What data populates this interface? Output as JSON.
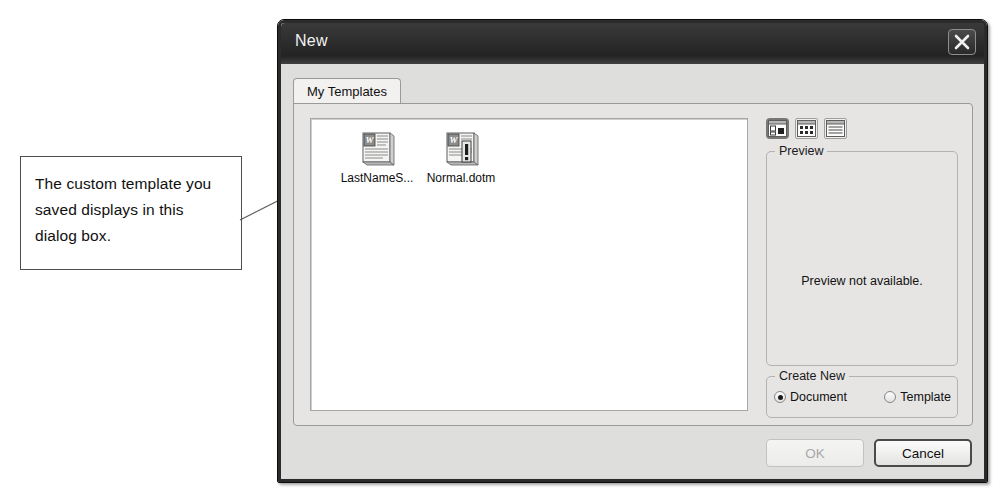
{
  "annotation": {
    "text": "The custom template you saved displays in this dialog box.",
    "leader_icon": "leader-line"
  },
  "dialog": {
    "title": "New",
    "close_icon": "close-icon",
    "tabs": [
      {
        "label": "My Templates",
        "selected": true
      }
    ],
    "templates": [
      {
        "label": "LastNameS...",
        "icon": "word-template-icon",
        "selected": false
      },
      {
        "label": "Normal.dotm",
        "icon": "word-macro-template-icon",
        "selected": false
      }
    ],
    "view_buttons": [
      {
        "icon": "large-icons-view-icon",
        "selected": true
      },
      {
        "icon": "small-icons-view-icon",
        "selected": false
      },
      {
        "icon": "details-view-icon",
        "selected": false
      }
    ],
    "preview": {
      "title": "Preview",
      "message": "Preview not available."
    },
    "create_new": {
      "title": "Create New",
      "options": [
        {
          "label": "Document",
          "checked": true
        },
        {
          "label": "Template",
          "checked": false
        }
      ]
    },
    "buttons": {
      "ok": "OK",
      "cancel": "Cancel"
    }
  }
}
